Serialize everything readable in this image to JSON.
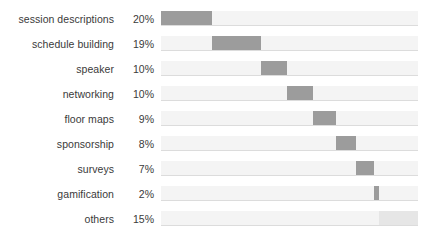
{
  "chart_data": {
    "type": "bar",
    "subtype": "waterfall-horizontal-cumulative",
    "title": "",
    "subtitle": "",
    "xlabel": "",
    "ylabel": "",
    "xlim": [
      0,
      100
    ],
    "grid": false,
    "legend": null,
    "units": "percent",
    "colors": {
      "segment": "#9c9c9c",
      "segment_muted": "#e6e6e6",
      "track": "#f4f4f4",
      "baseline": "#dcdcdc",
      "text": "#3a3a3a"
    },
    "categories": [
      "session descriptions",
      "schedule building",
      "speaker",
      "networking",
      "floor maps",
      "sponsorship",
      "surveys",
      "gamification",
      "others"
    ],
    "values": [
      20,
      19,
      10,
      10,
      9,
      8,
      7,
      2,
      15
    ],
    "value_labels": [
      "20%",
      "19%",
      "10%",
      "10%",
      "9%",
      "8%",
      "7%",
      "2%",
      "15%"
    ],
    "cumulative_start": [
      0,
      20,
      39,
      49,
      59,
      68,
      76,
      83,
      85
    ],
    "cumulative_end": [
      20,
      39,
      49,
      59,
      68,
      76,
      83,
      85,
      100
    ],
    "rows": [
      {
        "label": "session descriptions",
        "value": 20,
        "value_label": "20%",
        "start": 0,
        "end": 20,
        "muted": false
      },
      {
        "label": "schedule building",
        "value": 19,
        "value_label": "19%",
        "start": 20,
        "end": 39,
        "muted": false
      },
      {
        "label": "speaker",
        "value": 10,
        "value_label": "10%",
        "start": 39,
        "end": 49,
        "muted": false
      },
      {
        "label": "networking",
        "value": 10,
        "value_label": "10%",
        "start": 49,
        "end": 59,
        "muted": false
      },
      {
        "label": "floor maps",
        "value": 9,
        "value_label": "9%",
        "start": 59,
        "end": 68,
        "muted": false
      },
      {
        "label": "sponsorship",
        "value": 8,
        "value_label": "8%",
        "start": 68,
        "end": 76,
        "muted": false
      },
      {
        "label": "surveys",
        "value": 7,
        "value_label": "7%",
        "start": 76,
        "end": 83,
        "muted": false
      },
      {
        "label": "gamification",
        "value": 2,
        "value_label": "2%",
        "start": 83,
        "end": 85,
        "muted": false
      },
      {
        "label": "others",
        "value": 15,
        "value_label": "15%",
        "start": 85,
        "end": 100,
        "muted": true
      }
    ]
  }
}
